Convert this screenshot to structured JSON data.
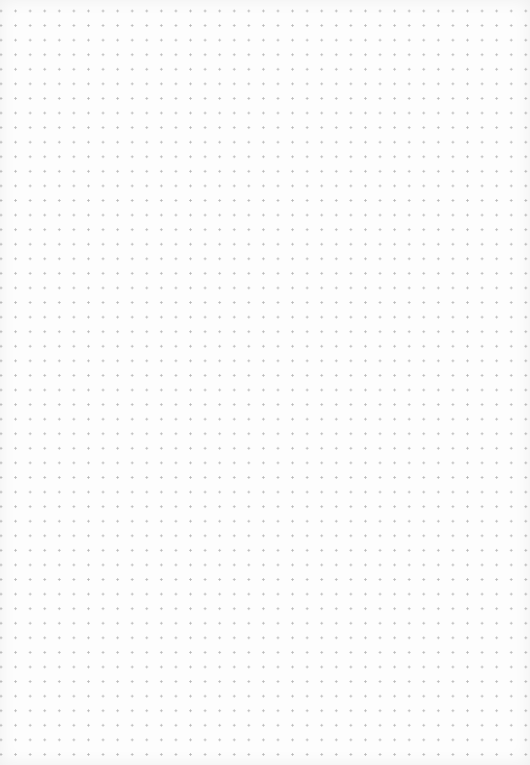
{
  "page": {
    "type": "dot-grid-paper",
    "background_color": "#fdfdfd",
    "dot_color": "#b9b9b9",
    "dot_spacing_px": 14.58,
    "columns": 36,
    "rows": 52
  }
}
